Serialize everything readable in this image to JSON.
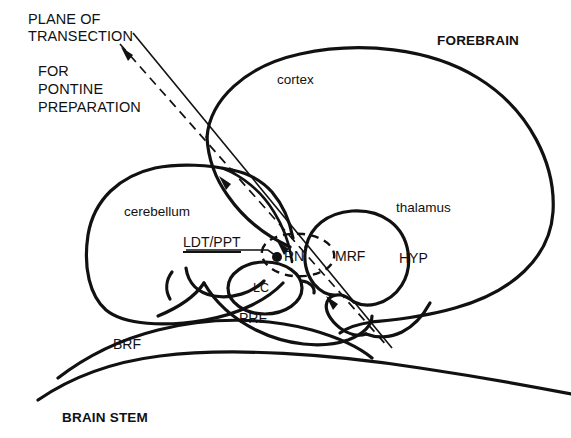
{
  "figure": {
    "kind": "anatomical-diagram",
    "background_color": "#ffffff",
    "line_color": "#111111"
  },
  "annotations": {
    "plane_label_line1": "PLANE OF",
    "plane_label_line2": "TRANSECTION",
    "prep_label_line1": "FOR",
    "prep_label_line2": "PONTINE",
    "prep_label_line3": "PREPARATION"
  },
  "region_labels": {
    "forebrain": "FOREBRAIN",
    "cortex": "cortex",
    "thalamus": "thalamus",
    "cerebellum": "cerebellum",
    "brain_stem": "BRAIN STEM",
    "hyp": "HYP",
    "mrf": "MRF",
    "rn": "RN",
    "lc": "LC",
    "prf": "PRF",
    "brf": "BRF",
    "ldt_ppt": "LDT/PPT"
  },
  "graphics": {
    "transection_dashed_line": "dashed diagonal line with arrowheads marking plane of transection",
    "transection_solid_leader": "thin solid leader line from PLANE OF TRANSECTION text",
    "ldt_ppt_marker": "filled dot marking LDT/PPT location",
    "rn_outline": "dashed ellipse enclosing RN",
    "lc_outline": "solid ellipse enclosing LC"
  }
}
